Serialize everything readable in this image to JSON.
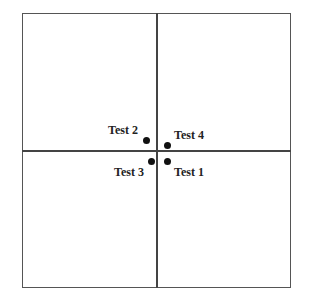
{
  "diagram": {
    "points": [
      {
        "label": "Test 2",
        "x": 146,
        "y": 140
      },
      {
        "label": "Test 4",
        "x": 167,
        "y": 145
      },
      {
        "label": "Test 3",
        "x": 152,
        "y": 161
      },
      {
        "label": "Test 1",
        "x": 167,
        "y": 161
      }
    ]
  }
}
